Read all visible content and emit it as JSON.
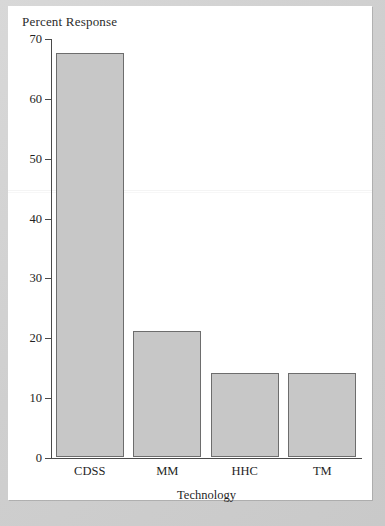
{
  "chart_data": {
    "type": "bar",
    "title": "",
    "categories": [
      "CDSS",
      "MM",
      "HHC",
      "TM"
    ],
    "values": [
      67.5,
      21,
      14,
      14
    ],
    "series": [
      {
        "name": "Percent Response",
        "values": [
          67.5,
          21,
          14,
          14
        ]
      }
    ],
    "xlabel": "Technology",
    "ylabel": "Percent Response",
    "ylim": [
      0,
      70
    ],
    "ytick_labels": [
      "0",
      "10",
      "20",
      "30",
      "40",
      "50",
      "60",
      "70"
    ],
    "ytick_values": [
      0,
      10,
      20,
      30,
      40,
      50,
      60,
      70
    ],
    "grid": false,
    "legend": false,
    "bar_color": "#c7c7c7",
    "bar_edge_color": "#6d6d6d",
    "axis_color": "#4a4a4a",
    "plot_background": "#ffffff",
    "page_background": "#d2d2d2"
  },
  "axes": {
    "y_title": "Percent Response",
    "x_title": "Technology"
  }
}
